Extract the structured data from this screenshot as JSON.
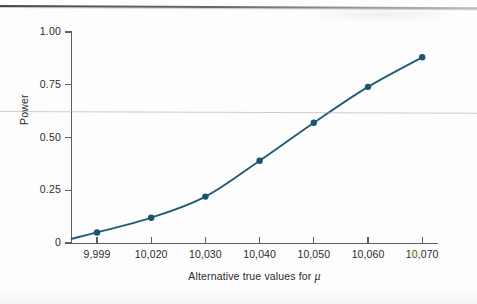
{
  "figure": {
    "kind": "statistics-power-curve-figure"
  },
  "chart_data": {
    "type": "line",
    "title": "",
    "xlabel_text": "Alternative true values for ",
    "xlabel_symbol": "μ",
    "ylabel": "Power",
    "x_tick_labels": [
      "9,999",
      "10,020",
      "10,030",
      "10,040",
      "10,050",
      "10,060",
      "10,070"
    ],
    "x_values": [
      9999,
      10020,
      10030,
      10040,
      10050,
      10060,
      10070
    ],
    "y_tick_labels": [
      "0",
      "0.25",
      "0.50",
      "0.75",
      "1.00"
    ],
    "y_ticks": [
      0,
      0.25,
      0.5,
      0.75,
      1.0
    ],
    "ylim": [
      0,
      1.0
    ],
    "values": [
      0.05,
      0.12,
      0.22,
      0.39,
      0.57,
      0.74,
      0.88
    ],
    "series": [
      {
        "name": "Power",
        "values": [
          0.05,
          0.12,
          0.22,
          0.39,
          0.57,
          0.74,
          0.88
        ]
      }
    ],
    "legend": [],
    "legend_position": "none",
    "grid": false,
    "marker": "filled-circle",
    "line_color": "#1f5d78",
    "marker_color": "#1b536c",
    "axis_color": "#5e5e5e"
  }
}
